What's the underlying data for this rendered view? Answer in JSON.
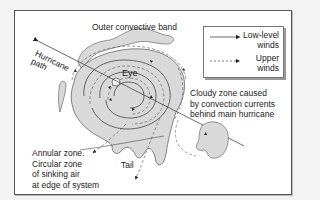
{
  "diagram": {
    "title_labels": {
      "outer_band": "Outer convective band",
      "path_line1": "Hurricane",
      "path_line2": "path",
      "eye": "Eye",
      "tail": "Tail"
    },
    "annular": {
      "line1": "Annular zone.",
      "line2": "Circular zone",
      "line3": "of sinking air",
      "line4": "at edge of system"
    },
    "cloudy": {
      "line1": "Cloudy zone caused",
      "line2": "by convection currents",
      "line3": "behind main hurricane"
    },
    "legend": {
      "low_line1": "Low-level",
      "low_line2": "winds",
      "up_line1": "Upper",
      "up_line2": "winds"
    },
    "colors": {
      "cloud_fill": "#d9d9d9",
      "stroke": "#444444"
    }
  }
}
